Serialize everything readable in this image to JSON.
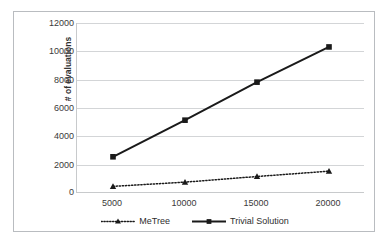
{
  "chart_data": {
    "type": "line",
    "title": "",
    "xlabel": "",
    "ylabel": "# of evaluations",
    "categories": [
      "5000",
      "10000",
      "15000",
      "20000"
    ],
    "x": [
      5000,
      10000,
      15000,
      20000
    ],
    "ylim": [
      0,
      12000
    ],
    "ytick_labels": [
      "0",
      "2000",
      "4000",
      "6000",
      "8000",
      "10000",
      "12000"
    ],
    "yticks": [
      0,
      2000,
      4000,
      6000,
      8000,
      10000,
      12000
    ],
    "grid": true,
    "legend_position": "bottom",
    "series": [
      {
        "name": "MeTree",
        "values": [
          400,
          700,
          1100,
          1480
        ],
        "line_style": "dotted",
        "marker": "triangle",
        "color": "#1a1a1a"
      },
      {
        "name": "Trivial Solution",
        "values": [
          2500,
          5100,
          7800,
          10300
        ],
        "line_style": "solid",
        "marker": "square",
        "color": "#1a1a1a"
      }
    ]
  },
  "legend": {
    "items": [
      {
        "label": "MeTree",
        "marker": "triangle-marker-icon",
        "style": "dotted"
      },
      {
        "label": "Trivial Solution",
        "marker": "square-marker-icon",
        "style": "solid"
      }
    ]
  },
  "colors": {
    "series": "#1a1a1a",
    "gridline": "#d3d5d7",
    "axis": "#c8cacc",
    "border": "#b9bcc0",
    "text": "#3a3a3a",
    "background": "#ffffff"
  }
}
